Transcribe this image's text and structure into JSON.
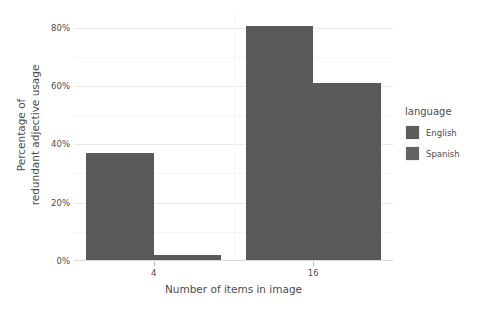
{
  "chart_data": {
    "type": "bar",
    "title": "",
    "subtitle": "",
    "xlabel": "Number of items in image",
    "ylabel_line1": "Percentage of",
    "ylabel_line2": "redundant adjective usage",
    "categories": [
      "4",
      "16"
    ],
    "series": [
      {
        "name": "English",
        "values": [
          37,
          80.5
        ],
        "color": "#595959"
      },
      {
        "name": "Spanish",
        "values": [
          2,
          61
        ],
        "color": "#595959"
      }
    ],
    "ylim": [
      0,
      86
    ],
    "yticks": [
      0,
      20,
      40,
      60,
      80
    ],
    "ytick_labels": [
      "0%",
      "20%",
      "40%",
      "60%",
      "80%"
    ],
    "yminor": [
      10,
      30,
      50,
      70
    ],
    "grid": true,
    "legend_position": "right",
    "legend_title": "language",
    "panel_background": "#ffffff",
    "grid_major_color": "#ebebeb",
    "grid_minor_color": "#f5f5f5",
    "axis_text_color": "#4d4d4d"
  },
  "legend": {
    "title": "language",
    "entries": [
      {
        "label": "English",
        "color": "#5c5c5c"
      },
      {
        "label": "Spanish",
        "color": "#636363"
      }
    ]
  },
  "axes": {
    "x_title": "Number of items in image",
    "x_tick_labels": [
      "4",
      "16"
    ],
    "y_title_line1": "Percentage of",
    "y_title_line2": "redundant adjective usage",
    "y_tick_labels": [
      "0%",
      "20%",
      "40%",
      "60%",
      "80%"
    ]
  }
}
